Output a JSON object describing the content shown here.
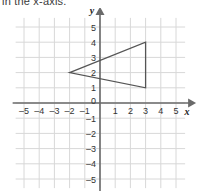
{
  "header": {
    "text": "in the x-axis."
  },
  "chart_data": {
    "type": "scatter",
    "title": "",
    "xlabel": "x",
    "ylabel": "y",
    "xlim": [
      -6,
      6
    ],
    "ylim": [
      -6,
      6
    ],
    "grid": true,
    "grid_step": 1,
    "legend": "none",
    "x_ticks": [
      -5,
      -4,
      -3,
      -2,
      -1,
      0,
      1,
      2,
      3,
      4,
      5
    ],
    "y_ticks": [
      5,
      4,
      3,
      2,
      1,
      0,
      -1,
      -2,
      -3,
      -4,
      -5
    ],
    "x_tick_labels": [
      "–5",
      "–4",
      "–3",
      "–2",
      "–1",
      "0",
      "1",
      "2",
      "3",
      "4",
      "5"
    ],
    "y_tick_labels": [
      "5",
      "4",
      "3",
      "2",
      "1",
      "0",
      "–1",
      "–2",
      "–3",
      "–4",
      "–5"
    ],
    "origin_label": "0",
    "shapes": [
      {
        "name": "triangle",
        "type": "polygon",
        "vertices": [
          [
            -2,
            2
          ],
          [
            3,
            4
          ],
          [
            3,
            1
          ]
        ],
        "stroke": "#555555",
        "fill": "none"
      }
    ],
    "colors": {
      "grid": "#d8d8d8",
      "axis": "#6a6a6a",
      "shape_stroke": "#555555",
      "tick_text": "#333333",
      "background": "#ffffff"
    }
  }
}
